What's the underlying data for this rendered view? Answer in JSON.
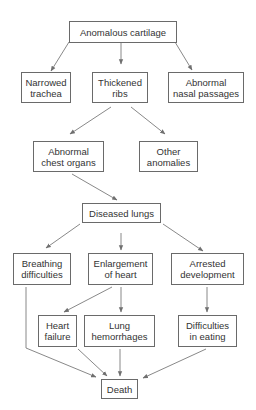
{
  "diagram": {
    "type": "flowchart",
    "colors": {
      "box_border": "#6a6a6a",
      "text": "#333333",
      "arrow": "#7a7a7a",
      "background": "#ffffff"
    },
    "nodes": {
      "anomalous_cartilage": {
        "lines": [
          "Anomalous cartilage"
        ]
      },
      "narrowed_trachea": {
        "lines": [
          "Narrowed",
          "trachea"
        ]
      },
      "thickened_ribs": {
        "lines": [
          "Thickened",
          "ribs"
        ]
      },
      "abnormal_nasal": {
        "lines": [
          "Abnormal",
          "nasal passages"
        ]
      },
      "abnormal_chest": {
        "lines": [
          "Abnormal",
          "chest organs"
        ]
      },
      "other_anomalies": {
        "lines": [
          "Other",
          "anomalies"
        ]
      },
      "diseased_lungs": {
        "lines": [
          "Diseased lungs"
        ]
      },
      "breathing_difficulties": {
        "lines": [
          "Breathing",
          "difficulties"
        ]
      },
      "enlargement_heart": {
        "lines": [
          "Enlargement",
          "of heart"
        ]
      },
      "arrested_development": {
        "lines": [
          "Arrested",
          "development"
        ]
      },
      "heart_failure": {
        "lines": [
          "Heart",
          "failure"
        ]
      },
      "lung_hemorrhages": {
        "lines": [
          "Lung",
          "hemorrhages"
        ]
      },
      "difficulties_eating": {
        "lines": [
          "Difficulties",
          "in eating"
        ]
      },
      "death": {
        "lines": [
          "Death"
        ]
      }
    },
    "edges": [
      [
        "anomalous_cartilage",
        "narrowed_trachea"
      ],
      [
        "anomalous_cartilage",
        "thickened_ribs"
      ],
      [
        "anomalous_cartilage",
        "abnormal_nasal"
      ],
      [
        "thickened_ribs",
        "abnormal_chest"
      ],
      [
        "thickened_ribs",
        "other_anomalies"
      ],
      [
        "abnormal_chest",
        "diseased_lungs"
      ],
      [
        "diseased_lungs",
        "breathing_difficulties"
      ],
      [
        "diseased_lungs",
        "enlargement_heart"
      ],
      [
        "diseased_lungs",
        "arrested_development"
      ],
      [
        "enlargement_heart",
        "heart_failure"
      ],
      [
        "enlargement_heart",
        "lung_hemorrhages"
      ],
      [
        "arrested_development",
        "difficulties_eating"
      ],
      [
        "breathing_difficulties",
        "death"
      ],
      [
        "heart_failure",
        "death"
      ],
      [
        "lung_hemorrhages",
        "death"
      ],
      [
        "difficulties_eating",
        "death"
      ]
    ]
  }
}
